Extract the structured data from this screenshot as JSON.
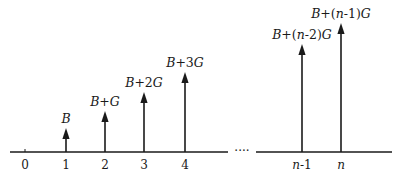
{
  "diagram": {
    "type": "impulse-sequence",
    "axis": {
      "y": 152,
      "left_segment": [
        10,
        228
      ],
      "right_segment": [
        256,
        392
      ],
      "ellipsis": "····",
      "ellipsis_x": 242
    },
    "ticks": [
      {
        "label": "0",
        "x": 25
      },
      {
        "label": "1",
        "x": 66
      },
      {
        "label": "2",
        "x": 105
      },
      {
        "label": "3",
        "x": 144
      },
      {
        "label": "4",
        "x": 185
      },
      {
        "label": "n-1",
        "x": 302
      },
      {
        "label": "n",
        "x": 341
      }
    ],
    "arrows": [
      {
        "x": 66,
        "top": 128,
        "label": "B",
        "label_x": 66
      },
      {
        "x": 105,
        "top": 111,
        "label": "B+G",
        "label_x": 105
      },
      {
        "x": 144,
        "top": 92,
        "label": "B+2G",
        "label_x": 144
      },
      {
        "x": 185,
        "top": 72,
        "label": "B+3G",
        "label_x": 185
      },
      {
        "x": 302,
        "top": 44,
        "label": "B+(n-2)G",
        "label_x": 302
      },
      {
        "x": 341,
        "top": 23,
        "label": "B+(n-1)G",
        "label_x": 341
      }
    ],
    "color": "#1a1a1a"
  }
}
